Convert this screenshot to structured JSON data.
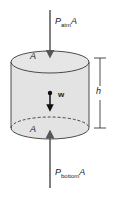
{
  "diagram": {
    "labels": {
      "top_force": "P",
      "top_force_sub": "atm",
      "top_force_suffix": "A",
      "bottom_force": "P",
      "bottom_force_sub": "bottom",
      "bottom_force_suffix": "A",
      "top_area": "A",
      "bottom_area": "A",
      "weight": "w",
      "height": "h"
    },
    "colors": {
      "fill": "#e3e3e3",
      "stroke": "#222222",
      "arrow": "#555555"
    }
  }
}
